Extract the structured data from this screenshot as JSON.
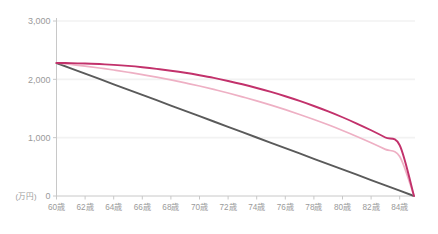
{
  "chart_data": {
    "type": "line",
    "title": "",
    "subtitle": "",
    "xlabel": "",
    "ylabel": "",
    "unit_label": "(万円)",
    "xlim": [
      60,
      85
    ],
    "ylim": [
      0,
      3000
    ],
    "grid": true,
    "grid_axis": "y",
    "legend": false,
    "legend_position": "none",
    "x_tick_labels": [
      "60歳",
      "62歳",
      "64歳",
      "66歳",
      "68歳",
      "70歳",
      "72歳",
      "74歳",
      "76歳",
      "78歳",
      "80歳",
      "82歳",
      "84歳"
    ],
    "x_ticks": [
      60,
      62,
      64,
      66,
      68,
      70,
      72,
      74,
      76,
      78,
      80,
      82,
      84
    ],
    "y_tick_labels": [
      "0",
      "1,000",
      "2,000",
      "3,000"
    ],
    "y_ticks": [
      0,
      1000,
      2000,
      3000
    ],
    "x": [
      60,
      61,
      62,
      63,
      64,
      65,
      66,
      67,
      68,
      69,
      70,
      71,
      72,
      73,
      74,
      75,
      76,
      77,
      78,
      79,
      80,
      81,
      82,
      83,
      84,
      85
    ],
    "series": [
      {
        "name": "crimson-curve",
        "color": "#c2316b",
        "values": [
          2280,
          2278,
          2272,
          2262,
          2248,
          2230,
          2207,
          2180,
          2148,
          2112,
          2070,
          2024,
          1972,
          1915,
          1852,
          1784,
          1710,
          1630,
          1543,
          1450,
          1350,
          1242,
          1127,
          1003,
          870,
          0
        ]
      },
      {
        "name": "light-pink-curve",
        "color": "#eeb0c4",
        "values": [
          2280,
          2254,
          2226,
          2194,
          2160,
          2122,
          2081,
          2037,
          1990,
          1939,
          1885,
          1827,
          1766,
          1700,
          1631,
          1558,
          1480,
          1398,
          1311,
          1220,
          1123,
          1021,
          913,
          799,
          678,
          0
        ]
      },
      {
        "name": "gray-line",
        "color": "#5a5a5a",
        "values": [
          2280,
          2189,
          2098,
          2006,
          1915,
          1824,
          1733,
          1642,
          1550,
          1459,
          1368,
          1277,
          1186,
          1094,
          1003,
          912,
          821,
          730,
          638,
          547,
          456,
          365,
          274,
          182,
          91,
          0
        ]
      }
    ],
    "colors": {
      "background": "#ffffff",
      "grid": "#f2f2f2",
      "axis": "#c8c8c8",
      "tick_text": "#9a9a9a",
      "series_crimson": "#c2316b",
      "series_pink": "#eeb0c4",
      "series_gray": "#5a5a5a"
    }
  }
}
